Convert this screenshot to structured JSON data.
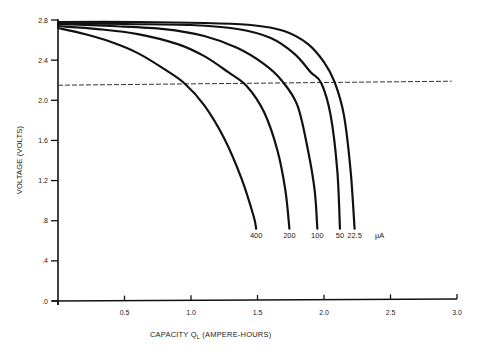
{
  "chart_data": {
    "type": "line",
    "title": "",
    "xlabel": "CAPACITY Q_L (AMPERE-HOURS)",
    "xlabel_main": "CAPACITY Q",
    "xlabel_sub": "L",
    "xlabel_rest": " (AMPERE-HOURS)",
    "ylabel": "VOLTAGE (VOLTS)",
    "xlim": [
      0,
      3.0
    ],
    "ylim": [
      0,
      2.8
    ],
    "x_ticks": [
      0,
      0.5,
      1.0,
      1.5,
      2.0,
      2.5,
      3.0
    ],
    "x_tick_labels": [
      "",
      "0.5",
      "1.0",
      "1.5",
      "2.0",
      "2.5",
      "3.0"
    ],
    "y_ticks": [
      0,
      0.4,
      0.8,
      1.2,
      1.6,
      2.0,
      2.4,
      2.8
    ],
    "y_tick_labels": [
      ".0",
      ".4",
      ".8",
      "1.2",
      "1.6",
      "2.0",
      "2.4",
      "2.8"
    ],
    "grid": false,
    "legend": "curve end labels, unit µA",
    "units_label": "µA",
    "series": [
      {
        "name": "400",
        "label": "400",
        "unit": "µA",
        "points": [
          [
            0,
            2.72
          ],
          [
            0.2,
            2.66
          ],
          [
            0.4,
            2.58
          ],
          [
            0.6,
            2.47
          ],
          [
            0.8,
            2.31
          ],
          [
            0.95,
            2.17
          ],
          [
            1.1,
            1.95
          ],
          [
            1.25,
            1.62
          ],
          [
            1.38,
            1.22
          ],
          [
            1.47,
            0.85
          ],
          [
            1.49,
            0.72
          ]
        ]
      },
      {
        "name": "200",
        "label": "200",
        "unit": "µA",
        "points": [
          [
            0,
            2.74
          ],
          [
            0.3,
            2.71
          ],
          [
            0.6,
            2.66
          ],
          [
            0.9,
            2.56
          ],
          [
            1.1,
            2.44
          ],
          [
            1.28,
            2.28
          ],
          [
            1.42,
            2.14
          ],
          [
            1.55,
            1.88
          ],
          [
            1.65,
            1.5
          ],
          [
            1.71,
            1.1
          ],
          [
            1.74,
            0.72
          ]
        ]
      },
      {
        "name": "100",
        "label": "100",
        "unit": "µA",
        "points": [
          [
            0,
            2.76
          ],
          [
            0.4,
            2.74
          ],
          [
            0.8,
            2.71
          ],
          [
            1.1,
            2.64
          ],
          [
            1.35,
            2.52
          ],
          [
            1.55,
            2.36
          ],
          [
            1.68,
            2.2
          ],
          [
            1.8,
            1.95
          ],
          [
            1.88,
            1.5
          ],
          [
            1.93,
            1.1
          ],
          [
            1.95,
            0.72
          ]
        ]
      },
      {
        "name": "50",
        "label": "50",
        "unit": "µA",
        "points": [
          [
            0,
            2.77
          ],
          [
            0.5,
            2.76
          ],
          [
            1.0,
            2.75
          ],
          [
            1.35,
            2.71
          ],
          [
            1.6,
            2.62
          ],
          [
            1.78,
            2.46
          ],
          [
            1.9,
            2.28
          ],
          [
            1.98,
            2.17
          ],
          [
            2.05,
            1.85
          ],
          [
            2.1,
            1.3
          ],
          [
            2.12,
            0.72
          ]
        ]
      },
      {
        "name": "22.5",
        "label": "22.5",
        "unit": "µA",
        "points": [
          [
            0,
            2.78
          ],
          [
            0.6,
            2.78
          ],
          [
            1.1,
            2.77
          ],
          [
            1.45,
            2.75
          ],
          [
            1.7,
            2.69
          ],
          [
            1.88,
            2.56
          ],
          [
            2.0,
            2.38
          ],
          [
            2.08,
            2.18
          ],
          [
            2.15,
            1.85
          ],
          [
            2.2,
            1.3
          ],
          [
            2.23,
            0.72
          ]
        ]
      }
    ],
    "reference_line": {
      "style": "dashed",
      "points": [
        [
          0,
          2.15
        ],
        [
          2.96,
          2.19
        ]
      ]
    }
  }
}
